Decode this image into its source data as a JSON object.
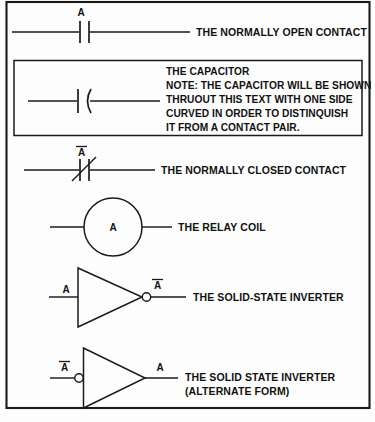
{
  "figure": {
    "background_color": "#fdfdfd",
    "line_color": "#1a1a1a"
  },
  "rows": [
    {
      "id": "normally-open-contact",
      "symbol": "normally-open-contact-symbol",
      "designator": "A",
      "designator_overbar": false,
      "caption": "THE  NORMALLY OPEN CONTACT"
    },
    {
      "id": "capacitor",
      "symbol": "capacitor-symbol",
      "designator": "",
      "designator_overbar": false,
      "caption_lines": [
        "THE CAPACITOR",
        "NOTE: THE CAPACITOR WILL BE SHOWN",
        "THRUOUT THIS TEXT WITH ONE SIDE",
        "CURVED IN ORDER TO DISTINQUISH",
        "IT FROM A CONTACT PAIR."
      ]
    },
    {
      "id": "normally-closed-contact",
      "symbol": "normally-closed-contact-symbol",
      "designator": "A",
      "designator_overbar": true,
      "caption": "THE NORMALLY CLOSED CONTACT"
    },
    {
      "id": "relay-coil",
      "symbol": "relay-coil-symbol",
      "designator": "A",
      "designator_overbar": false,
      "caption": "THE RELAY COIL"
    },
    {
      "id": "solid-state-inverter",
      "symbol": "inverter-symbol",
      "input_label": "A",
      "input_overbar": false,
      "output_label": "A",
      "output_overbar": true,
      "bubble_side": "output",
      "caption": "THE SOLID-STATE INVERTER"
    },
    {
      "id": "solid-state-inverter-alternate",
      "symbol": "inverter-symbol-alternate",
      "input_label": "A",
      "input_overbar": true,
      "output_label": "A",
      "output_overbar": false,
      "bubble_side": "input",
      "caption_lines": [
        "THE SOLID STATE INVERTER",
        "(ALTERNATE FORM)"
      ]
    }
  ]
}
